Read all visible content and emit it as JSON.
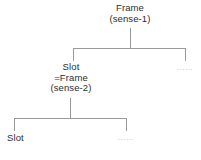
{
  "diagram": {
    "type": "tree",
    "line_color": "#9a9a9a",
    "text_color": "#2e2e2e",
    "ellipsis_color": "#b4b4b4",
    "background": "#ffffff",
    "nodes": {
      "root": {
        "id": "frame-sense-1",
        "line1": "Frame",
        "line2": "(sense-1)"
      },
      "middle": {
        "id": "slot-frame-sense-2",
        "line1": "Slot",
        "line2": "=Frame",
        "line3": "(sense-2)"
      },
      "leaf": {
        "id": "slot-leaf",
        "line1": "Slot"
      },
      "ellipsis_upper": {
        "id": "ellipsis-upper",
        "label": "……"
      },
      "ellipsis_lower": {
        "id": "ellipsis-lower",
        "label": "……"
      }
    }
  }
}
